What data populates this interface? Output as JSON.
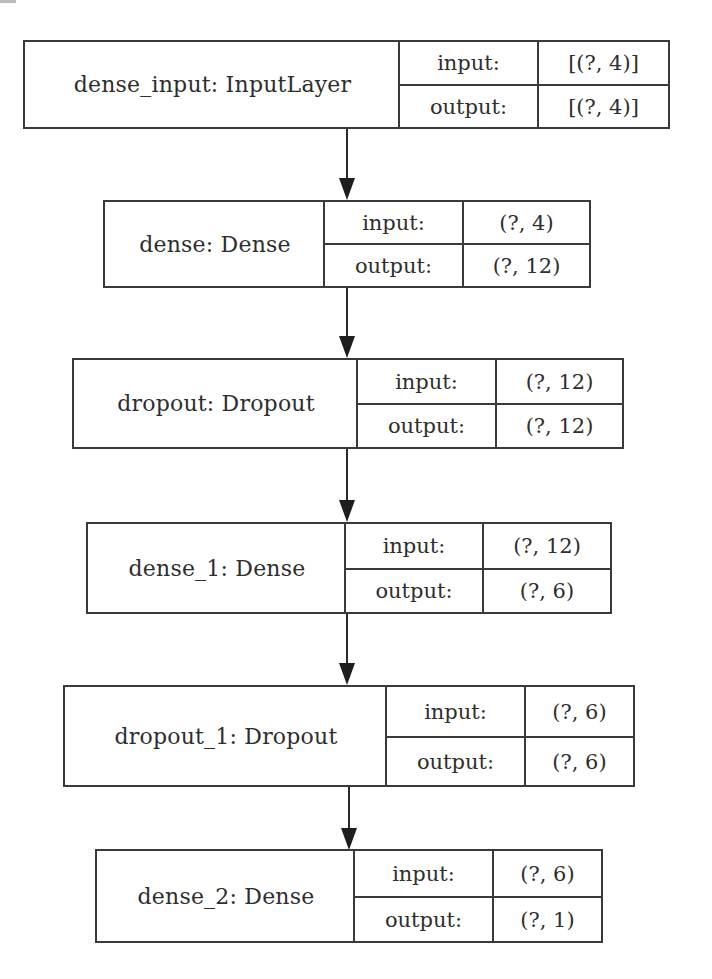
{
  "diagram": {
    "type": "keras-model-plot",
    "nodes": [
      {
        "name": "dense_input: InputLayer",
        "input_label": "input:",
        "input_shape": "[(?, 4)]",
        "output_label": "output:",
        "output_shape": "[(?, 4)]"
      },
      {
        "name": "dense: Dense",
        "input_label": "input:",
        "input_shape": "(?, 4)",
        "output_label": "output:",
        "output_shape": "(?, 12)"
      },
      {
        "name": "dropout: Dropout",
        "input_label": "input:",
        "input_shape": "(?, 12)",
        "output_label": "output:",
        "output_shape": "(?, 12)"
      },
      {
        "name": "dense_1: Dense",
        "input_label": "input:",
        "input_shape": "(?, 12)",
        "output_label": "output:",
        "output_shape": "(?, 6)"
      },
      {
        "name": "dropout_1: Dropout",
        "input_label": "input:",
        "input_shape": "(?, 6)",
        "output_label": "output:",
        "output_shape": "(?, 6)"
      },
      {
        "name": "dense_2: Dense",
        "input_label": "input:",
        "input_shape": "(?, 6)",
        "output_label": "output:",
        "output_shape": "(?, 1)"
      }
    ],
    "edges": [
      {
        "from": "dense_input",
        "to": "dense"
      },
      {
        "from": "dense",
        "to": "dropout"
      },
      {
        "from": "dropout",
        "to": "dense_1"
      },
      {
        "from": "dense_1",
        "to": "dropout_1"
      },
      {
        "from": "dropout_1",
        "to": "dense_2"
      }
    ],
    "colors": {
      "line": "#3a3a3a",
      "text": "#2e2e2e",
      "background": "#ffffff"
    }
  }
}
